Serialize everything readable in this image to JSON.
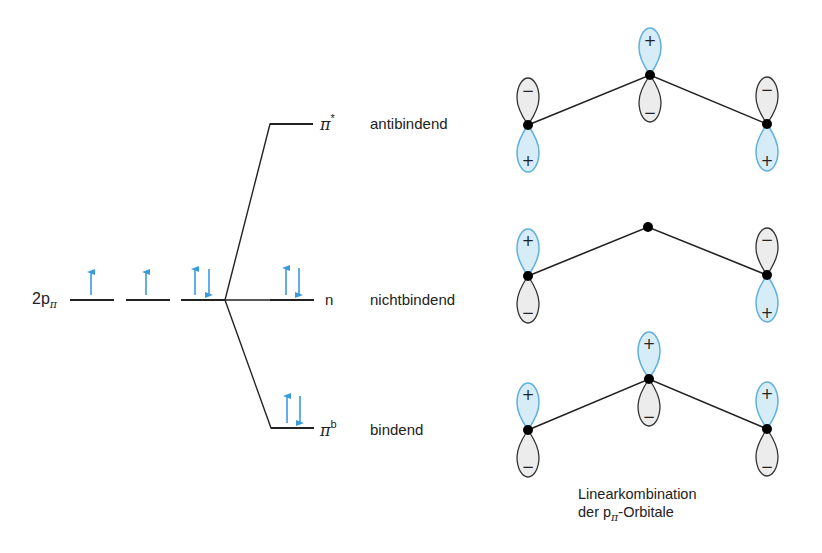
{
  "diagram": {
    "colors": {
      "line": "#222222",
      "electron": "#3a9bdc",
      "plus_lobe_fill": "#d6edf8",
      "plus_lobe_stroke": "#5fb0de",
      "minus_lobe_fill": "#ececec",
      "minus_lobe_stroke": "#333333",
      "atom": "#000000"
    },
    "atomic_orbitals": {
      "label_main": "2p",
      "label_sub": "π",
      "levels": [
        {
          "electrons": "↑"
        },
        {
          "electrons": "↑"
        },
        {
          "electrons": "↑↓"
        }
      ]
    },
    "molecular_orbitals": [
      {
        "symbol": "π",
        "superscript": "*",
        "description": "antibindend",
        "electrons": "",
        "phases": [
          "-/+",
          "+/-",
          "-/+"
        ]
      },
      {
        "symbol": "n",
        "superscript": "",
        "description": "nichtbindend",
        "electrons": "↑↓",
        "phases": [
          "+/-",
          "node",
          "-/+"
        ]
      },
      {
        "symbol": "π",
        "superscript": "b",
        "description": "bindend",
        "electrons": "↑↓",
        "phases": [
          "+/-",
          "+/-",
          "+/-"
        ]
      }
    ],
    "lobe_signs": {
      "plus": "+",
      "minus": "−"
    },
    "caption": {
      "line1": "Linearkombination",
      "line2_prefix": "der p",
      "line2_sub": "π",
      "line2_suffix": "-Orbitale"
    }
  }
}
